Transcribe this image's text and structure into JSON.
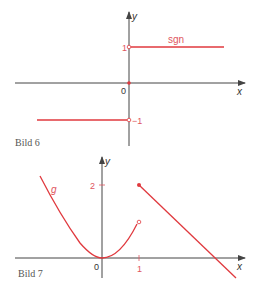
{
  "colors": {
    "axis": "#444444",
    "curve": "#e0393e",
    "label_red": "#e05560",
    "caption": "#555555"
  },
  "figure6": {
    "caption": "Bild 6",
    "function_label": "sgn",
    "axis_x_label": "x",
    "axis_y_label": "y",
    "origin_label": "0",
    "tick_pos_label": "1",
    "tick_neg_label": "−1"
  },
  "figure7": {
    "caption": "Bild 7",
    "function_label": "g",
    "axis_x_label": "x",
    "axis_y_label": "y",
    "origin_label": "0",
    "tick_y_label": "2",
    "tick_x_label": "1"
  }
}
